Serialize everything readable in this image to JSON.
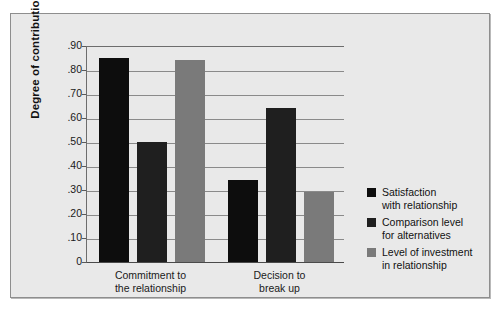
{
  "figure": {
    "background_color": "#e9e9e9",
    "frame_color": "#8e8e8e"
  },
  "chart_data": {
    "type": "bar",
    "title": "",
    "xlabel": "",
    "ylabel": "Degree of contribution",
    "ylim": [
      0,
      0.9
    ],
    "grid": true,
    "legend_position": "right",
    "categories": [
      "Commitment to\nthe relationship",
      "Decision to\nbreak up"
    ],
    "tick_labels": [
      ".90",
      ".80",
      ".70",
      ".60",
      ".50",
      ".40",
      ".30",
      ".20",
      ".10",
      "0"
    ],
    "tick_values": [
      0.9,
      0.8,
      0.7,
      0.6,
      0.5,
      0.4,
      0.3,
      0.2,
      0.1,
      0
    ],
    "series": [
      {
        "name": "Satisfaction\nwith relationship",
        "color": "#0d0d0d",
        "values": [
          0.85,
          0.34
        ]
      },
      {
        "name": "Comparison level\nfor alternatives",
        "color": "#1f1f1f",
        "values": [
          0.5,
          0.64
        ]
      },
      {
        "name": "Level of investment\nin relationship",
        "color": "#7a7a7a",
        "values": [
          0.84,
          0.29
        ]
      }
    ]
  }
}
